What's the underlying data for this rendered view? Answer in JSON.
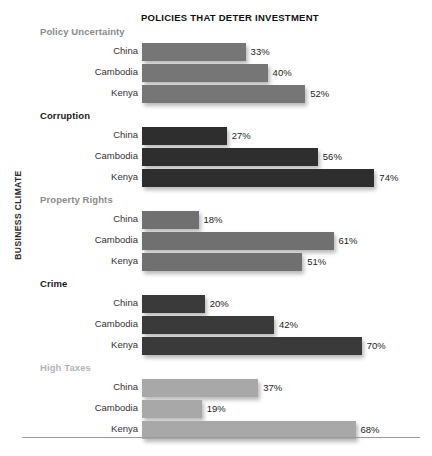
{
  "chart_title": "POLICIES THAT DETER INVESTMENT",
  "axis_title": "BUSINESS CLIMATE",
  "chart_data": {
    "type": "bar",
    "orientation": "horizontal",
    "title": "POLICIES THAT DETER INVESTMENT",
    "xlabel": "",
    "ylabel": "BUSINESS CLIMATE",
    "xlim": [
      0,
      80
    ],
    "grid": false,
    "legend": "none",
    "value_suffix": "%",
    "categories": [
      "China",
      "Cambodia",
      "Kenya"
    ],
    "groups": [
      {
        "name": "Policy Uncertainty",
        "color": "#767676",
        "bars": [
          {
            "category": "China",
            "value": 33,
            "label": "33%"
          },
          {
            "category": "Cambodia",
            "value": 40,
            "label": "40%"
          },
          {
            "category": "Kenya",
            "value": 52,
            "label": "52%"
          }
        ]
      },
      {
        "name": "Corruption",
        "color": "#2e2e2e",
        "bars": [
          {
            "category": "China",
            "value": 27,
            "label": "27%"
          },
          {
            "category": "Cambodia",
            "value": 56,
            "label": "56%"
          },
          {
            "category": "Kenya",
            "value": 74,
            "label": "74%"
          }
        ]
      },
      {
        "name": "Property Rights",
        "color": "#707070",
        "bars": [
          {
            "category": "China",
            "value": 18,
            "label": "18%"
          },
          {
            "category": "Cambodia",
            "value": 61,
            "label": "61%"
          },
          {
            "category": "Kenya",
            "value": 51,
            "label": "51%"
          }
        ]
      },
      {
        "name": "Crime",
        "color": "#3a3a3a",
        "bars": [
          {
            "category": "China",
            "value": 20,
            "label": "20%"
          },
          {
            "category": "Cambodia",
            "value": 42,
            "label": "42%"
          },
          {
            "category": "Kenya",
            "value": 70,
            "label": "70%"
          }
        ]
      },
      {
        "name": "High Taxes",
        "color": "#a8a8a8",
        "bars": [
          {
            "category": "China",
            "value": 37,
            "label": "37%"
          },
          {
            "category": "Cambodia",
            "value": 19,
            "label": "19%"
          },
          {
            "category": "Kenya",
            "value": 68,
            "label": "68%"
          }
        ]
      }
    ]
  },
  "group_header_colors": {
    "Policy Uncertainty": "#8a8a8a",
    "Corruption": "#1a1a1a",
    "Property Rights": "#8a8a8a",
    "Crime": "#1a1a1a",
    "High Taxes": "#b4b4b4"
  },
  "scale": {
    "bar_origin_px": 142,
    "px_per_percent": 3.14
  }
}
